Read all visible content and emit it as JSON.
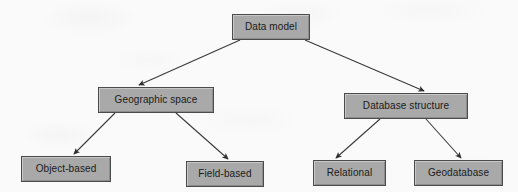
{
  "diagram": {
    "type": "hierarchy-tree",
    "background_color": "#fbfbfb",
    "node_fill_color": "#a9a9a9",
    "node_border_color": "#4b4b4b",
    "edge_color": "#3a3a3a",
    "text_color": "#1a1a1a",
    "nodes": [
      {
        "id": "data-model",
        "label": "Data model",
        "level": 0,
        "x": 232,
        "y": 14,
        "w": 78,
        "h": 26
      },
      {
        "id": "geographic-space",
        "label": "Geographic space",
        "level": 1,
        "x": 98,
        "y": 87,
        "w": 116,
        "h": 26
      },
      {
        "id": "database-structure",
        "label": "Database structure",
        "level": 1,
        "x": 344,
        "y": 93,
        "w": 124,
        "h": 26
      },
      {
        "id": "object-based",
        "label": "Object-based",
        "level": 2,
        "x": 21,
        "y": 156,
        "w": 90,
        "h": 26
      },
      {
        "id": "field-based",
        "label": "Field-based",
        "level": 2,
        "x": 186,
        "y": 161,
        "w": 78,
        "h": 26
      },
      {
        "id": "relational",
        "label": "Relational",
        "level": 2,
        "x": 313,
        "y": 160,
        "w": 73,
        "h": 26
      },
      {
        "id": "geodatabase",
        "label": "Geodatabase",
        "level": 2,
        "x": 414,
        "y": 160,
        "w": 89,
        "h": 26
      }
    ],
    "edges": [
      {
        "id": "edge-data-model-geographic-space",
        "from": "data-model",
        "to": "geographic-space",
        "x1": 240,
        "y1": 40,
        "x2": 139,
        "y2": 85
      },
      {
        "id": "edge-data-model-database-structure",
        "from": "data-model",
        "to": "database-structure",
        "x1": 305,
        "y1": 40,
        "x2": 424,
        "y2": 91
      },
      {
        "id": "edge-geographic-space-object-based",
        "from": "geographic-space",
        "to": "object-based",
        "x1": 115,
        "y1": 113,
        "x2": 74,
        "y2": 154
      },
      {
        "id": "edge-geographic-space-field-based",
        "from": "geographic-space",
        "to": "field-based",
        "x1": 176,
        "y1": 113,
        "x2": 228,
        "y2": 159
      },
      {
        "id": "edge-database-structure-relational",
        "from": "database-structure",
        "to": "relational",
        "x1": 380,
        "y1": 119,
        "x2": 336,
        "y2": 158
      },
      {
        "id": "edge-database-structure-geodatabase",
        "from": "database-structure",
        "to": "geodatabase",
        "x1": 426,
        "y1": 119,
        "x2": 461,
        "y2": 158
      }
    ]
  }
}
